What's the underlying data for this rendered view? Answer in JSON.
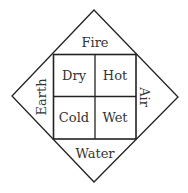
{
  "diagram": {
    "elements": {
      "top": "Fire",
      "left": "Earth",
      "right": "Air",
      "bottom": "Water"
    },
    "qualities": {
      "top_left": "Dry",
      "top_right": "Hot",
      "bottom_left": "Cold",
      "bottom_right": "Wet"
    },
    "colors": {
      "line": "#222222",
      "text": "#333333",
      "background": "#ffffff"
    }
  }
}
